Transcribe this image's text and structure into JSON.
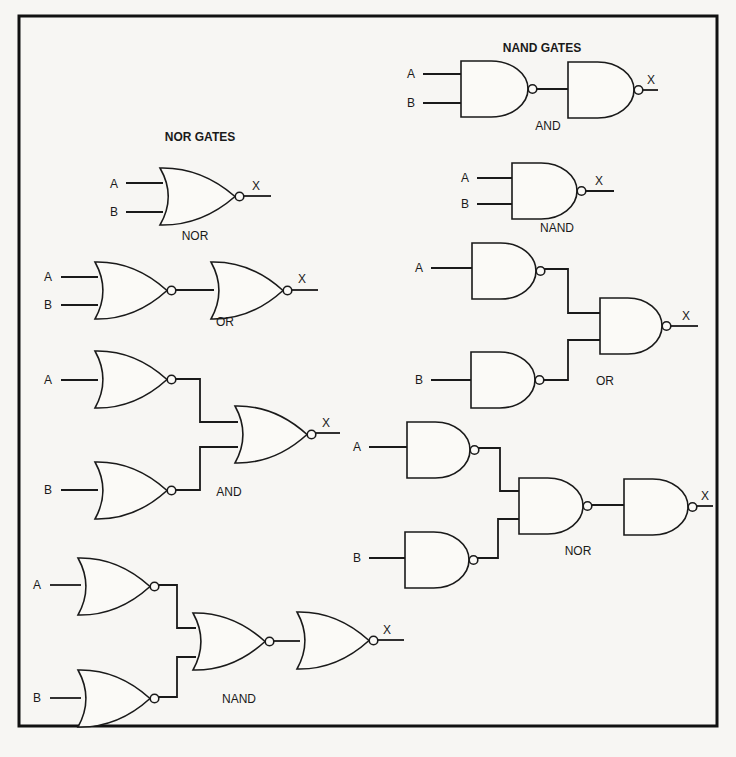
{
  "diagram": {
    "sections": {
      "nor": {
        "title": "NOR GATES",
        "title_pos": [
          200,
          141
        ]
      },
      "nand": {
        "title": "NAND GATES",
        "title_pos": [
          542,
          52
        ]
      }
    },
    "labels": {
      "input_a": "A",
      "input_b": "B",
      "output": "X"
    },
    "circuits": [
      {
        "id": "nor-nor",
        "section": "nor",
        "label": "NOR",
        "label_pos": [
          195,
          240
        ]
      },
      {
        "id": "nor-or",
        "section": "nor",
        "label": "OR",
        "label_pos": [
          225,
          326
        ]
      },
      {
        "id": "nor-and",
        "section": "nor",
        "label": "AND",
        "label_pos": [
          229,
          496
        ]
      },
      {
        "id": "nor-nand",
        "section": "nor",
        "label": "NAND",
        "label_pos": [
          239,
          703
        ]
      },
      {
        "id": "nand-and",
        "section": "nand",
        "label": "AND",
        "label_pos": [
          548,
          130
        ]
      },
      {
        "id": "nand-nand",
        "section": "nand",
        "label": "NAND",
        "label_pos": [
          557,
          232
        ]
      },
      {
        "id": "nand-or",
        "section": "nand",
        "label": "OR",
        "label_pos": [
          605,
          385
        ]
      },
      {
        "id": "nand-nor",
        "section": "nand",
        "label": "NOR",
        "label_pos": [
          578,
          555
        ]
      }
    ],
    "gates": [
      {
        "type": "nor",
        "x": 160,
        "y": 168,
        "w": 75,
        "h": 57
      },
      {
        "type": "nor",
        "x": 95,
        "y": 262,
        "w": 72,
        "h": 57
      },
      {
        "type": "nor",
        "x": 211,
        "y": 262,
        "w": 72,
        "h": 57
      },
      {
        "type": "nor",
        "x": 95,
        "y": 351,
        "w": 72,
        "h": 57
      },
      {
        "type": "nor",
        "x": 235,
        "y": 406,
        "w": 72,
        "h": 57
      },
      {
        "type": "nor",
        "x": 95,
        "y": 462,
        "w": 72,
        "h": 57
      },
      {
        "type": "nor",
        "x": 78,
        "y": 558,
        "w": 72,
        "h": 57
      },
      {
        "type": "nor",
        "x": 193,
        "y": 613,
        "w": 72,
        "h": 57
      },
      {
        "type": "nor",
        "x": 297,
        "y": 612,
        "w": 72,
        "h": 57
      },
      {
        "type": "nor",
        "x": 78,
        "y": 670,
        "w": 72,
        "h": 57
      },
      {
        "type": "nand",
        "x": 461,
        "y": 61,
        "w": 67,
        "h": 56
      },
      {
        "type": "nand",
        "x": 568,
        "y": 62,
        "w": 66,
        "h": 56
      },
      {
        "type": "nand",
        "x": 512,
        "y": 163,
        "w": 65,
        "h": 56
      },
      {
        "type": "nand",
        "x": 472,
        "y": 243,
        "w": 64,
        "h": 56
      },
      {
        "type": "nand",
        "x": 600,
        "y": 298,
        "w": 62,
        "h": 56
      },
      {
        "type": "nand",
        "x": 471,
        "y": 352,
        "w": 64,
        "h": 56
      },
      {
        "type": "nand",
        "x": 407,
        "y": 422,
        "w": 63,
        "h": 56
      },
      {
        "type": "nand",
        "x": 519,
        "y": 478,
        "w": 64,
        "h": 56
      },
      {
        "type": "nand",
        "x": 624,
        "y": 479,
        "w": 64,
        "h": 56
      },
      {
        "type": "nand",
        "x": 405,
        "y": 532,
        "w": 64,
        "h": 56
      }
    ],
    "wires": [
      "M126,183 H163",
      "M126,212 H163",
      "M240,196 H271",
      "M61,277 H98",
      "M61,305 H98",
      "M172,290 H214",
      "M288,290 H318",
      "M61,380 H98",
      "M172,379 H200 V422 H238",
      "M172,490 H200 V447 H238",
      "M312,433 H340",
      "M61,490 H98",
      "M50,585 H81",
      "M155,585 H177 V628 H196",
      "M155,697 H177 V657 H196",
      "M270,641 H300",
      "M374,640 H404",
      "M50,698 H81",
      "M423,74 H461",
      "M423,103 H461",
      "M532,89 H568",
      "M638,90 H658",
      "M477,178 H512",
      "M477,204 H512",
      "M581,191 H614",
      "M431,268 H472",
      "M540,269 H568 V313 H600",
      "M539,380 H568 V340 H600",
      "M666,326 H698",
      "M431,380 H471",
      "M369,447 H407",
      "M474,448 H500 V491 H519",
      "M473,558 H498 V519 H519",
      "M587,505 H624",
      "M692,506 H713",
      "M369,558 H405"
    ],
    "inputs": [
      {
        "text": "A",
        "pos": [
          114,
          188
        ]
      },
      {
        "text": "B",
        "pos": [
          114,
          216
        ]
      },
      {
        "text": "A",
        "pos": [
          48,
          281
        ]
      },
      {
        "text": "B",
        "pos": [
          48,
          309
        ]
      },
      {
        "text": "A",
        "pos": [
          48,
          384
        ]
      },
      {
        "text": "B",
        "pos": [
          48,
          494
        ]
      },
      {
        "text": "A",
        "pos": [
          37,
          589
        ]
      },
      {
        "text": "B",
        "pos": [
          37,
          702
        ]
      },
      {
        "text": "A",
        "pos": [
          411,
          78
        ]
      },
      {
        "text": "B",
        "pos": [
          411,
          107
        ]
      },
      {
        "text": "A",
        "pos": [
          465,
          182
        ]
      },
      {
        "text": "B",
        "pos": [
          465,
          208
        ]
      },
      {
        "text": "A",
        "pos": [
          419,
          272
        ]
      },
      {
        "text": "B",
        "pos": [
          419,
          384
        ]
      },
      {
        "text": "A",
        "pos": [
          357,
          451
        ]
      },
      {
        "text": "B",
        "pos": [
          357,
          562
        ]
      }
    ],
    "outputs": [
      {
        "text": "X",
        "pos": [
          256,
          190
        ]
      },
      {
        "text": "X",
        "pos": [
          302,
          283
        ]
      },
      {
        "text": "X",
        "pos": [
          326,
          427
        ]
      },
      {
        "text": "X",
        "pos": [
          387,
          634
        ]
      },
      {
        "text": "X",
        "pos": [
          651,
          84
        ]
      },
      {
        "text": "X",
        "pos": [
          599,
          185
        ]
      },
      {
        "text": "X",
        "pos": [
          686,
          320
        ]
      },
      {
        "text": "X",
        "pos": [
          705,
          500
        ]
      }
    ],
    "frame": {
      "x": 19,
      "y": 16,
      "w": 698,
      "h": 710
    }
  }
}
